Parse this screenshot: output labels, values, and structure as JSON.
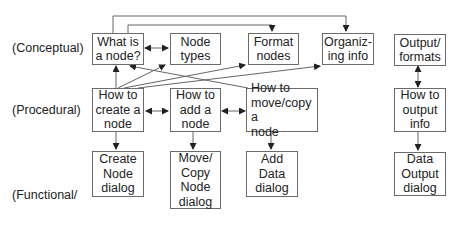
{
  "row_labels": {
    "conceptual": "(Conceptual)",
    "procedural": "(Procedural)",
    "functional_line1": "(Functional/",
    "functional_line2": "field help)"
  },
  "nodes": {
    "what_is_node": {
      "line1": "What is",
      "line2": "a node?"
    },
    "node_types": {
      "line1": "Node",
      "line2": "types"
    },
    "format_nodes": {
      "line1": "Format",
      "line2": "nodes"
    },
    "organizing_info": {
      "line1": "Organiz-",
      "line2": "ing info"
    },
    "output_formats": {
      "line1": "Output/",
      "line2": "formats"
    },
    "create_node": {
      "line1": "How to",
      "line2": "create a",
      "line3": "node"
    },
    "add_node": {
      "line1": "How to",
      "line2": "add a",
      "line3": "node"
    },
    "move_copy_node": {
      "line1": "How to",
      "line2": "move/copy a",
      "line3": "node"
    },
    "output_info": {
      "line1": "How to",
      "line2": "output",
      "line3": "info"
    },
    "create_node_dialog": {
      "line1": "Create",
      "line2": "Node",
      "line3": "dialog"
    },
    "move_copy_dialog": {
      "line1": "Move/",
      "line2": "Copy",
      "line3": "Node",
      "line4": "dialog"
    },
    "add_data_dialog": {
      "line1": "Add",
      "line2": "Data",
      "line3": "dialog"
    },
    "data_output_dialog": {
      "line1": "Data",
      "line2": "Output",
      "line3": "dialog"
    }
  },
  "edges": [
    {
      "from": "What is a node?",
      "to": "Node types",
      "type": "bidirectional"
    },
    {
      "from": "What is a node?",
      "to": "Organizing info",
      "type": "directed"
    },
    {
      "from": "What is a node?",
      "to": "Format nodes",
      "type": "directed"
    },
    {
      "from": "How to create a node",
      "to": "What is a node?",
      "type": "directed"
    },
    {
      "from": "How to create a node",
      "to": "Node types",
      "type": "directed"
    },
    {
      "from": "How to create a node",
      "to": "Format nodes",
      "type": "directed"
    },
    {
      "from": "How to create a node",
      "to": "Organizing info",
      "type": "directed"
    },
    {
      "from": "How to move/copy a node",
      "to": "What is a node?",
      "type": "directed"
    },
    {
      "from": "How to create a node",
      "to": "How to add a node",
      "type": "bidirectional"
    },
    {
      "from": "How to add a node",
      "to": "How to move/copy a node",
      "type": "bidirectional"
    },
    {
      "from": "How to create a node",
      "to": "Create Node dialog",
      "type": "directed"
    },
    {
      "from": "How to add a node",
      "to": "Move/Copy Node dialog",
      "type": "directed"
    },
    {
      "from": "How to move/copy a node",
      "to": "Add Data dialog",
      "type": "directed"
    },
    {
      "from": "Output/formats",
      "to": "How to output info",
      "type": "bidirectional"
    },
    {
      "from": "How to output info",
      "to": "Data Output dialog",
      "type": "directed"
    }
  ],
  "colors": {
    "line": "#555555",
    "border": "#6b6b6b",
    "text": "#222222"
  }
}
